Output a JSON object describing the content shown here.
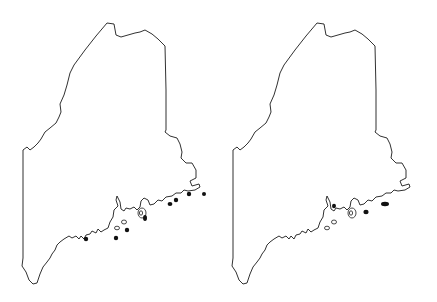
{
  "maps": [
    {
      "name": "left-map",
      "offset_x": 0,
      "dots": [
        {
          "x": 86,
          "y": 239,
          "rx": 2.2,
          "ry": 2.2
        },
        {
          "x": 116,
          "y": 238,
          "rx": 2.2,
          "ry": 2.2
        },
        {
          "x": 127,
          "y": 230,
          "rx": 2.2,
          "ry": 2.2
        },
        {
          "x": 145,
          "y": 218,
          "rx": 2.0,
          "ry": 3.0
        },
        {
          "x": 170,
          "y": 204,
          "rx": 2.4,
          "ry": 2.0
        },
        {
          "x": 176,
          "y": 200,
          "rx": 2.2,
          "ry": 2.2
        },
        {
          "x": 189,
          "y": 194,
          "rx": 2.2,
          "ry": 2.2
        },
        {
          "x": 204,
          "y": 194,
          "rx": 2.0,
          "ry": 2.0
        }
      ]
    },
    {
      "name": "right-map",
      "offset_x": 210,
      "dots": [
        {
          "x": 334,
          "y": 206,
          "rx": 2.0,
          "ry": 2.2
        },
        {
          "x": 366,
          "y": 212,
          "rx": 2.6,
          "ry": 2.2
        },
        {
          "x": 385,
          "y": 204,
          "rx": 4.0,
          "ry": 2.2
        }
      ]
    }
  ],
  "colors": {
    "outline": "#1a1a1a",
    "dot": "#111111",
    "background": "#ffffff"
  }
}
